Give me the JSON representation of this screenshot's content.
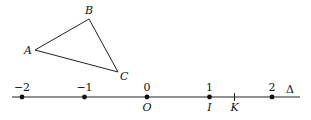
{
  "triangle": {
    "vertices": [
      {
        "name": "A"
      },
      {
        "name": "B"
      },
      {
        "name": "C"
      }
    ]
  },
  "number_line": {
    "name": "Δ",
    "ticks": [
      {
        "value": -2,
        "label": "−2",
        "point": ""
      },
      {
        "value": -1,
        "label": "−1",
        "point": ""
      },
      {
        "value": 0,
        "label": "0",
        "point": "O"
      },
      {
        "value": 1,
        "label": "1",
        "point": "I"
      },
      {
        "value": 2,
        "label": "2",
        "point": ""
      }
    ],
    "marks": [
      {
        "value": 1.4,
        "label": "K"
      }
    ]
  }
}
